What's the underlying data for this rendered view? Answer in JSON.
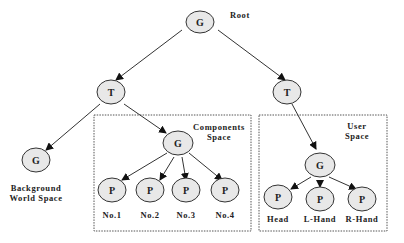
{
  "diagram": {
    "type": "scene-graph-tree",
    "nodes": {
      "root": {
        "glyph": "G",
        "label": "Root"
      },
      "t_left": {
        "glyph": "T"
      },
      "t_right": {
        "glyph": "T"
      },
      "background": {
        "glyph": "G",
        "label_line1": "Background",
        "label_line2": "World Space"
      },
      "comp_group": {
        "glyph": "G"
      },
      "comp_p1": {
        "glyph": "P",
        "label": "No.1"
      },
      "comp_p2": {
        "glyph": "P",
        "label": "No.2"
      },
      "comp_p3": {
        "glyph": "P",
        "label": "No.3"
      },
      "comp_p4": {
        "glyph": "P",
        "label": "No.4"
      },
      "user_group": {
        "glyph": "G"
      },
      "user_head": {
        "glyph": "P",
        "label": "Head"
      },
      "user_lhand": {
        "glyph": "P",
        "label": "L-Hand"
      },
      "user_rhand": {
        "glyph": "P",
        "label": "R-Hand"
      }
    },
    "regions": {
      "components": {
        "line1": "Components",
        "line2": "Space"
      },
      "user": {
        "line1": "User",
        "line2": "Space"
      }
    },
    "edges": [
      [
        "root",
        "t_left"
      ],
      [
        "root",
        "t_right"
      ],
      [
        "t_left",
        "background"
      ],
      [
        "t_left",
        "comp_group"
      ],
      [
        "comp_group",
        "comp_p1"
      ],
      [
        "comp_group",
        "comp_p2"
      ],
      [
        "comp_group",
        "comp_p3"
      ],
      [
        "comp_group",
        "comp_p4"
      ],
      [
        "t_right",
        "user_group"
      ],
      [
        "user_group",
        "user_head"
      ],
      [
        "user_group",
        "user_lhand"
      ],
      [
        "user_group",
        "user_rhand"
      ]
    ]
  }
}
